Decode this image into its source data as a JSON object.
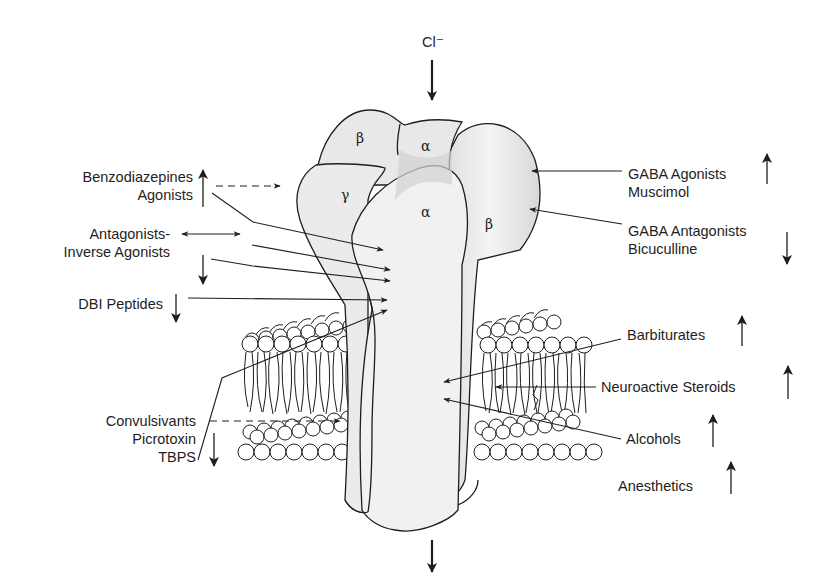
{
  "diagram": {
    "ion": {
      "label": "Cl⁻",
      "flow": "inward through channel"
    },
    "subunits": [
      {
        "id": "beta_back",
        "label": "β"
      },
      {
        "id": "alpha_back",
        "label": "α"
      },
      {
        "id": "gamma",
        "label": "γ"
      },
      {
        "id": "alpha_front",
        "label": "α"
      },
      {
        "id": "beta_front",
        "label": "β"
      }
    ],
    "left_labels": [
      {
        "id": "benzo",
        "lines": [
          "Benzodiazepines",
          "Agonists"
        ],
        "effect": "up",
        "arrow": "dashed-right"
      },
      {
        "id": "antag",
        "lines": [
          "Antagonists-",
          "Inverse Agonists"
        ],
        "effect": "down",
        "arrow": "double-horizontal"
      },
      {
        "id": "dbi",
        "lines": [
          "DBI Peptides"
        ],
        "effect": "down"
      },
      {
        "id": "convulsivants",
        "lines": [
          "Convulsivants",
          "Picrotoxin",
          "TBPS"
        ],
        "effect": "down",
        "arrow": "dashed-right"
      }
    ],
    "right_labels": [
      {
        "id": "gaba_ag",
        "lines": [
          "GABA Agonists",
          "Muscimol"
        ],
        "effect": "up"
      },
      {
        "id": "gaba_antag",
        "lines": [
          "GABA Antagonists",
          "Bicuculline"
        ],
        "effect": "down"
      },
      {
        "id": "barbiturates",
        "lines": [
          "Barbiturates"
        ],
        "effect": "up"
      },
      {
        "id": "steroids",
        "lines": [
          "Neuroactive Steroids"
        ],
        "effect": "up"
      },
      {
        "id": "alcohols",
        "lines": [
          "Alcohols"
        ],
        "effect": "up"
      },
      {
        "id": "anesthetics",
        "lines": [
          "Anesthetics"
        ],
        "effect": "up"
      }
    ],
    "colors": {
      "line": "#1e1e1e",
      "protein_fill": "#ececec",
      "protein_shade": "#d4d4d4",
      "background": "#ffffff"
    }
  }
}
